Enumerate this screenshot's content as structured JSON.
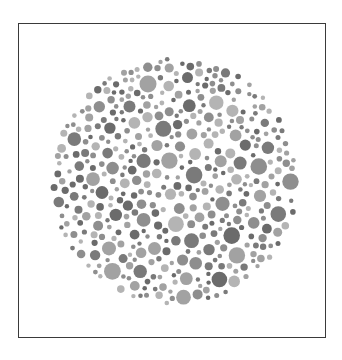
{
  "figure": {
    "type": "color-vision-test-plate",
    "frame": {
      "x": 18,
      "y": 23,
      "width": 308,
      "height": 315,
      "stroke": "#3a3a3a"
    },
    "plate": {
      "center_x": 175,
      "center_y": 181,
      "radius": 125,
      "dot_colors": [
        "#6b6b6b",
        "#7a7a7a",
        "#8e8e8e",
        "#a2a2a2",
        "#b4b4b4"
      ],
      "min_dot_radius": 2.2,
      "max_dot_radius": 8.5,
      "seed": 7
    }
  }
}
